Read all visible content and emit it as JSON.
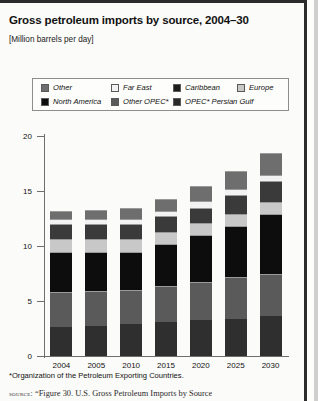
{
  "header": {
    "title": "Gross petroleum imports by source, 2004–30",
    "subtitle": "[Million barrels per day]"
  },
  "legend": {
    "row1": [
      {
        "label": "Other",
        "color": "#6e6e6e",
        "name": "legend-other"
      },
      {
        "label": "Far East",
        "color": "#f2f2f2",
        "name": "legend-far-east"
      },
      {
        "label": "Caribbean",
        "color": "#1c1c1c",
        "name": "legend-caribbean"
      },
      {
        "label": "Europe",
        "color": "#c8c8c8",
        "name": "legend-europe"
      }
    ],
    "row2": [
      {
        "label": "North America",
        "color": "#0d0d0d",
        "name": "legend-north-america"
      },
      {
        "label": "Other OPEC*",
        "color": "#5a5a5a",
        "name": "legend-other-opec"
      },
      {
        "label": "OPEC* Persian Gulf",
        "color": "#2a2a2a",
        "name": "legend-opec-persian-gulf"
      }
    ]
  },
  "axis": {
    "y_ticks": [
      "0",
      "5",
      "10",
      "15",
      "20"
    ],
    "x_labels": [
      "2004",
      "2005",
      "2010",
      "2015",
      "2020",
      "2025",
      "2030"
    ]
  },
  "footnote": "*Organization of the Petroleum Exporting Countries.",
  "source": {
    "label": "source:",
    "text": "“Figure 30. U.S. Gross Petroleum Imports by Source"
  },
  "chart_data": {
    "type": "bar",
    "stacked": true,
    "title": "Gross petroleum imports by source, 2004–30",
    "xlabel": "",
    "ylabel": "Million barrels per day",
    "ylim": [
      0,
      20
    ],
    "yticks": [
      0,
      5,
      10,
      15,
      20
    ],
    "grid": false,
    "legend_position": "top",
    "categories": [
      "2004",
      "2005",
      "2010",
      "2015",
      "2020",
      "2025",
      "2030"
    ],
    "series": [
      {
        "name": "Other OPEC*",
        "color": "#2f2f2f",
        "values": [
          2.6,
          2.7,
          2.9,
          3.1,
          3.3,
          3.4,
          3.6
        ]
      },
      {
        "name": "OPEC* Persian Gulf",
        "color": "#5a5a5a",
        "values": [
          3.2,
          3.2,
          3.1,
          3.3,
          3.4,
          3.8,
          3.9
        ]
      },
      {
        "name": "North America",
        "color": "#0d0d0d",
        "values": [
          3.7,
          3.6,
          3.5,
          3.8,
          4.3,
          4.6,
          5.4
        ]
      },
      {
        "name": "Europe",
        "color": "#c8c8c8",
        "values": [
          1.1,
          1.1,
          1.1,
          1.1,
          1.1,
          1.1,
          1.1
        ]
      },
      {
        "name": "Caribbean",
        "color": "#3a3a3a",
        "values": [
          1.4,
          1.4,
          1.4,
          1.4,
          1.4,
          1.7,
          1.9
        ]
      },
      {
        "name": "Far East",
        "color": "#f2f2f2",
        "values": [
          0.5,
          0.5,
          0.5,
          0.5,
          0.6,
          0.6,
          0.6
        ]
      },
      {
        "name": "Other",
        "color": "#6e6e6e",
        "values": [
          0.7,
          0.8,
          1.0,
          1.1,
          1.4,
          1.6,
          2.0
        ]
      }
    ],
    "totals": [
      13.2,
      13.3,
      13.5,
      14.3,
      15.5,
      16.8,
      18.5
    ]
  }
}
